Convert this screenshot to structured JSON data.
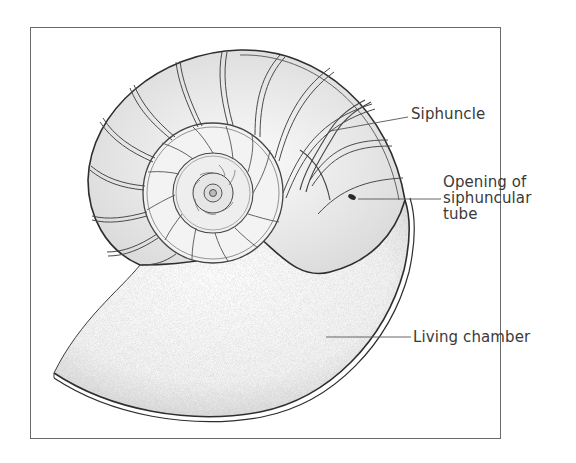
{
  "figure": {
    "labels": {
      "siphuncle": "Siphuncle",
      "opening_line1": "Opening of",
      "opening_line2": "siphuncular",
      "opening_line3": "tube",
      "living_chamber": "Living chamber"
    },
    "colors": {
      "ink": "#3a3a3a",
      "frame": "#6a6a6a",
      "stipple": "#9a9a9a",
      "background": "#ffffff"
    }
  }
}
